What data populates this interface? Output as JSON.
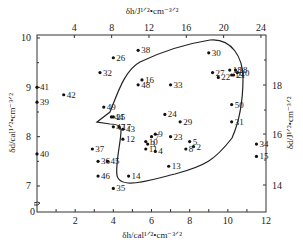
{
  "chart_data": {
    "type": "scatter",
    "title": "",
    "xlabel": "δh/cal^1/2·cm^-3/2",
    "ylabel": "δd/cal^1/2·cm^-3/2",
    "x2label": "δh/J^1/2·cm^-3/2",
    "y2label": "δd/J^1/2·cm^-3/2",
    "xlim": [
      0,
      12
    ],
    "ylim": [
      6.7,
      10
    ],
    "x_ticks": [
      "2",
      "4",
      "6",
      "8",
      "10",
      "12"
    ],
    "y_ticks": [
      "10",
      "9",
      "8",
      "7",
      "0"
    ],
    "x2_ticks": [
      "4",
      "8",
      "12",
      "16",
      "20",
      "24"
    ],
    "y2_ticks": [
      "18",
      "16",
      "14"
    ],
    "grid": false,
    "annotations": [
      "solubility region boundary curve",
      "axis break on left y-axis"
    ],
    "points": [
      {
        "label": "41",
        "x": 0.0,
        "y": 9.0
      },
      {
        "label": "42",
        "x": 1.4,
        "y": 8.85
      },
      {
        "label": "39",
        "x": 0.0,
        "y": 8.7
      },
      {
        "label": "40",
        "x": 0.0,
        "y": 7.65
      },
      {
        "label": "32",
        "x": 3.3,
        "y": 9.3
      },
      {
        "label": "26",
        "x": 4.0,
        "y": 9.6
      },
      {
        "label": "38",
        "x": 5.3,
        "y": 9.75
      },
      {
        "label": "49",
        "x": 3.5,
        "y": 8.6
      },
      {
        "label": "44",
        "x": 3.9,
        "y": 8.4
      },
      {
        "label": "25",
        "x": 4.0,
        "y": 8.4
      },
      {
        "label": "17",
        "x": 4.3,
        "y": 8.2
      },
      {
        "label": "47",
        "x": 4.0,
        "y": 8.2
      },
      {
        "label": "43",
        "x": 4.5,
        "y": 8.15
      },
      {
        "label": "12",
        "x": 4.5,
        "y": 7.95
      },
      {
        "label": "37",
        "x": 2.9,
        "y": 7.75
      },
      {
        "label": "36",
        "x": 3.2,
        "y": 7.5
      },
      {
        "label": "45",
        "x": 3.7,
        "y": 7.5
      },
      {
        "label": "46",
        "x": 3.2,
        "y": 7.2
      },
      {
        "label": "35",
        "x": 4.0,
        "y": 6.95
      },
      {
        "label": "14",
        "x": 4.8,
        "y": 7.2
      },
      {
        "label": "16",
        "x": 5.5,
        "y": 9.15
      },
      {
        "label": "48",
        "x": 5.3,
        "y": 9.05
      },
      {
        "label": "33",
        "x": 7.0,
        "y": 9.05
      },
      {
        "label": "24",
        "x": 6.7,
        "y": 8.45
      },
      {
        "label": "29",
        "x": 7.5,
        "y": 8.3
      },
      {
        "label": "7",
        "x": 6.0,
        "y": 8.0
      },
      {
        "label": "9",
        "x": 6.2,
        "y": 8.05
      },
      {
        "label": "23",
        "x": 7.0,
        "y": 8.0
      },
      {
        "label": "10",
        "x": 5.7,
        "y": 7.9
      },
      {
        "label": "3",
        "x": 5.8,
        "y": 7.85
      },
      {
        "label": "11",
        "x": 5.7,
        "y": 7.75
      },
      {
        "label": "4",
        "x": 6.2,
        "y": 7.7
      },
      {
        "label": "5",
        "x": 8.0,
        "y": 7.9
      },
      {
        "label": "2",
        "x": 8.2,
        "y": 7.8
      },
      {
        "label": "8",
        "x": 7.8,
        "y": 7.75
      },
      {
        "label": "13",
        "x": 6.9,
        "y": 7.4
      },
      {
        "label": "30",
        "x": 9.0,
        "y": 9.7
      },
      {
        "label": "27",
        "x": 9.2,
        "y": 9.3
      },
      {
        "label": "22",
        "x": 9.5,
        "y": 9.2
      },
      {
        "label": "18",
        "x": 10.1,
        "y": 9.35
      },
      {
        "label": "28",
        "x": 10.4,
        "y": 9.35
      },
      {
        "label": "20",
        "x": 10.5,
        "y": 9.3
      },
      {
        "label": "19",
        "x": 10.2,
        "y": 9.25
      },
      {
        "label": "21",
        "x": 10.3,
        "y": 9.25
      },
      {
        "label": "50",
        "x": 10.2,
        "y": 8.65
      },
      {
        "label": "31",
        "x": 10.2,
        "y": 8.3
      },
      {
        "label": "34",
        "x": 11.5,
        "y": 7.85
      },
      {
        "label": "15",
        "x": 11.5,
        "y": 7.6
      }
    ]
  }
}
